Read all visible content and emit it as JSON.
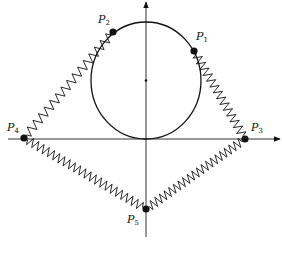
{
  "diagram": {
    "title": "",
    "colors": {
      "stroke": "#111111",
      "axis": "#333333",
      "background": "#ffffff"
    },
    "axes": {
      "x_axis": {
        "y": 139,
        "x_start": 8,
        "x_end": 280,
        "arrow": "right"
      },
      "y_axis": {
        "x": 146,
        "y_start": 237,
        "y_end": 2,
        "arrow": "up"
      }
    },
    "circle": {
      "cx": 146,
      "cy": 80.5,
      "rx": 55,
      "ry": 58.5,
      "center_marker": true
    },
    "points": [
      {
        "id": "P1",
        "label": "P",
        "sub": "1",
        "x": 194,
        "y": 51,
        "label_x": 196,
        "label_y": 31
      },
      {
        "id": "P2",
        "label": "P",
        "sub": "2",
        "x": 113,
        "y": 32,
        "label_x": 98,
        "label_y": 14
      },
      {
        "id": "P3",
        "label": "P",
        "sub": "3",
        "x": 245,
        "y": 139,
        "label_x": 251,
        "label_y": 122
      },
      {
        "id": "P4",
        "label": "P",
        "sub": "4",
        "x": 24,
        "y": 138,
        "label_x": 7,
        "label_y": 122
      },
      {
        "id": "P5",
        "label": "P",
        "sub": "5",
        "x": 146,
        "y": 209,
        "label_x": 127,
        "label_y": 214
      }
    ],
    "springs": [
      {
        "from": "P1",
        "to": "P3",
        "coils": 14
      },
      {
        "from": "P2",
        "to": "P4",
        "coils": 15
      },
      {
        "from": "P4",
        "to": "P5",
        "coils": 22
      },
      {
        "from": "P5",
        "to": "P3",
        "coils": 20
      }
    ]
  }
}
